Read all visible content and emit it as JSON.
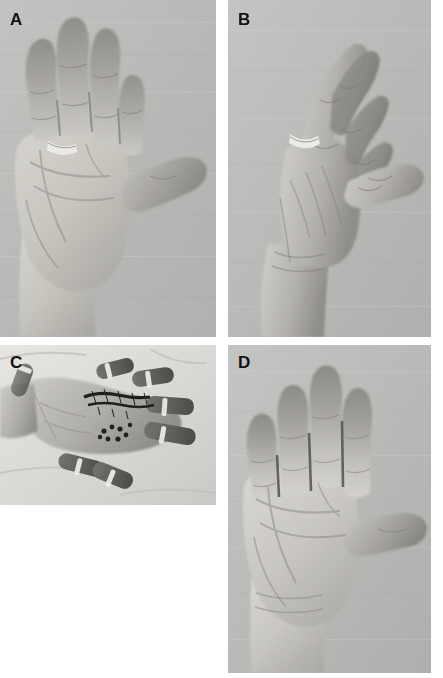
{
  "figure": {
    "type": "clinical-photograph-composite",
    "panel_count": 4,
    "layout": "2x2 grid",
    "background_color": "#ffffff",
    "photo_background_color": "#b9bbb9"
  },
  "panels": [
    {
      "id": "A",
      "label": "A",
      "position": "top-left",
      "view": "palmar view of left hand, fingers extended and abducted",
      "description": "Preoperative palmar view showing hand with index, middle, ring and little fingers extended, thumb abducted laterally. A plain metal ring is worn on the ring finger. Palm shows pale skin with prominent creases; fingertips appear darker.",
      "features": [
        "ring on ring finger",
        "thumb abducted",
        "pale palm with deep creases",
        "darker finger pads"
      ],
      "skin_tone": "#c8c6c0",
      "shadow_tone": "#6f6d68"
    },
    {
      "id": "B",
      "label": "B",
      "position": "top-right",
      "view": "lateral/oblique view of hand with fingers flexed",
      "description": "Preoperative lateral view showing the same hand from the radial side with the fingers partially flexed and the thumb extended away from the palm. The ring is visible on the ring finger; the wrist and forearm extend toward the bottom of the frame.",
      "features": [
        "ring visible on ring finger",
        "fingers in partial flexion",
        "thumb extended",
        "wrist and distal forearm visible"
      ],
      "skin_tone": "#bfbdb6",
      "shadow_tone": "#6a6863"
    },
    {
      "id": "C",
      "label": "C",
      "position": "bottom-left",
      "view": "intraoperative palmar exposure",
      "description": "Intraoperative photograph of the palm on a white surgical drape. Fingers are held apart by fabric retention loops/strips. The palmar skin is opened with dark suture material and small dark puncture marks visible over the distal palm and digits.",
      "features": [
        "white surgical drape",
        "finger retention strips",
        "open palmar incision",
        "dark sutures",
        "small dark puncture marks"
      ],
      "skin_tone": "#b6b4ad",
      "drape_tone": "#e4e3df",
      "suture_color": "#171717"
    },
    {
      "id": "D",
      "label": "D",
      "position": "bottom-right",
      "view": "postoperative palmar view, fingers extended",
      "description": "Postoperative palmar view showing full extension of all fingers with the thumb widely abducted. Finger creases and healed palmar skin are visible; no ring is present. Fingers are adducted together with thin dark shadow lines between them.",
      "features": [
        "full finger extension achieved",
        "thumb widely abducted",
        "no ring present",
        "fingers adducted with dark interdigital shadows",
        "visible palmar creases"
      ],
      "skin_tone": "#c6c4be",
      "shadow_tone": "#6d6b66"
    }
  ]
}
